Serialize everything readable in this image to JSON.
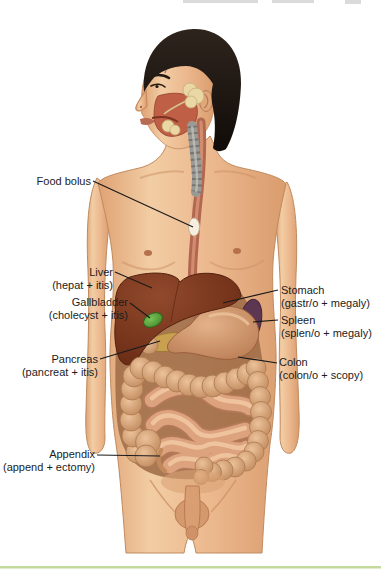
{
  "labels": {
    "left": [
      {
        "id": "food-bolus",
        "line1": "Food bolus",
        "line2": ""
      },
      {
        "id": "liver",
        "line1": "Liver",
        "line2": "(hepat + itis)"
      },
      {
        "id": "gallbladder",
        "line1": "Gallbladder",
        "line2": "(cholecyst + itis)"
      },
      {
        "id": "pancreas",
        "line1": "Pancreas",
        "line2": "(pancreat + itis)"
      },
      {
        "id": "appendix",
        "line1": "Appendix",
        "line2": "(append + ectomy)"
      }
    ],
    "right": [
      {
        "id": "stomach",
        "line1": "Stomach",
        "line2": "(gastr/o + megaly)"
      },
      {
        "id": "spleen",
        "line1": "Spleen",
        "line2": "(splen/o + megaly)"
      },
      {
        "id": "colon",
        "line1": "Colon",
        "line2": "(colon/o + scopy)"
      }
    ]
  },
  "colors": {
    "skin": "#ecb78e",
    "hair": "#1c1410",
    "liver": "#7a3a22",
    "stomach": "#cd9068",
    "spleen": "#5d3652",
    "gallbladder": "#55a23a",
    "pancreas": "#c9a050",
    "colon": "#d6a47c",
    "small_intestine": "#dda37f",
    "esophagus": "#b26750",
    "trachea": "#9b9995",
    "leader_line": "#1a1a1a",
    "label_text": "#1c1c1c",
    "bottom_rule": "#c3da9b"
  }
}
